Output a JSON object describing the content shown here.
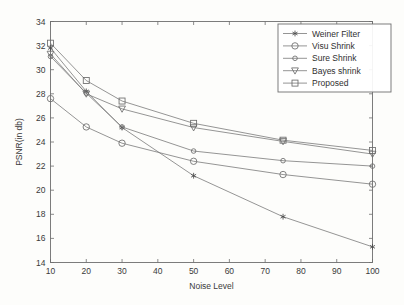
{
  "chart_data": {
    "type": "line",
    "title": "",
    "xlabel": "Noise Level",
    "ylabel": "PSNR(in db)",
    "x": [
      10,
      20,
      30,
      50,
      75,
      100
    ],
    "xlim": [
      10,
      100
    ],
    "ylim": [
      14,
      34
    ],
    "xticks": [
      10,
      20,
      30,
      40,
      50,
      60,
      70,
      80,
      90,
      100
    ],
    "yticks": [
      14,
      16,
      18,
      20,
      22,
      24,
      26,
      28,
      30,
      32,
      34
    ],
    "xtick_labels": [
      "10",
      "20",
      "30",
      "40",
      "50",
      "60",
      "70",
      "80",
      "90",
      "100"
    ],
    "ytick_labels": [
      "14",
      "16",
      "18",
      "20",
      "22",
      "24",
      "26",
      "28",
      "30",
      "32",
      "34"
    ],
    "grid": false,
    "legend_position": "upper right",
    "series": [
      {
        "name": "Weiner Filter",
        "marker": "star",
        "values": [
          31.8,
          28.2,
          25.2,
          21.2,
          17.8,
          15.3
        ]
      },
      {
        "name": "Visu Shrink",
        "marker": "circle",
        "values": [
          27.6,
          25.25,
          23.9,
          22.4,
          21.3,
          20.5
        ]
      },
      {
        "name": "Sure Shrink",
        "marker": "circle-small",
        "values": [
          31.1,
          28.05,
          25.25,
          23.25,
          22.45,
          22.0
        ]
      },
      {
        "name": "Bayes shrink",
        "marker": "triangle-down",
        "values": [
          31.3,
          28.0,
          26.75,
          25.2,
          24.05,
          23.0
        ]
      },
      {
        "name": "Proposed",
        "marker": "square",
        "values": [
          32.2,
          29.1,
          27.4,
          25.55,
          24.15,
          23.3
        ]
      }
    ]
  },
  "legend": {
    "entries": [
      {
        "label": "Weiner Filter"
      },
      {
        "label": "Visu Shrink"
      },
      {
        "label": "Sure Shrink"
      },
      {
        "label": "Bayes shrink"
      },
      {
        "label": "Proposed"
      }
    ]
  },
  "colors": {
    "axis": "#6f6f6f",
    "line": "#7a7a7a",
    "text": "#3a3a3a",
    "background": "#fdfdfb"
  }
}
